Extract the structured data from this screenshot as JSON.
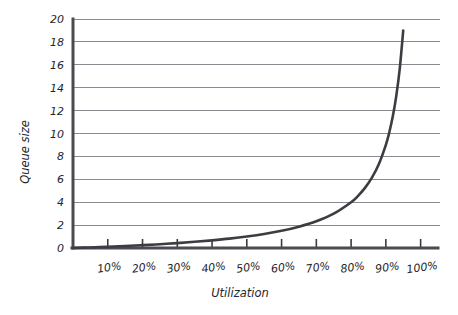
{
  "chart_data": {
    "type": "line",
    "title": "",
    "xlabel": "Utilization",
    "ylabel": "Queue size",
    "xlim": [
      0,
      105
    ],
    "ylim": [
      0,
      20
    ],
    "grid": true,
    "legend": false,
    "x_tick_labels": [
      "10%",
      "20%",
      "30%",
      "40%",
      "50%",
      "60%",
      "70%",
      "80%",
      "90%",
      "100%"
    ],
    "x_tick_values": [
      10,
      20,
      30,
      40,
      50,
      60,
      70,
      80,
      90,
      100
    ],
    "y_tick_labels": [
      "0",
      "2",
      "4",
      "6",
      "8",
      "10",
      "12",
      "14",
      "16",
      "18",
      "20"
    ],
    "y_tick_values": [
      0,
      2,
      4,
      6,
      8,
      10,
      12,
      14,
      16,
      18,
      20
    ],
    "series": [
      {
        "name": "Queue size",
        "color": "#3c3c42",
        "x": [
          0,
          5,
          10,
          15,
          20,
          25,
          30,
          35,
          40,
          45,
          50,
          55,
          60,
          65,
          70,
          75,
          80,
          82,
          84,
          86,
          88,
          90,
          91,
          92,
          93,
          94,
          95
        ],
        "values": [
          0,
          0.05,
          0.11,
          0.18,
          0.25,
          0.33,
          0.43,
          0.54,
          0.67,
          0.82,
          1.0,
          1.22,
          1.5,
          1.86,
          2.33,
          3.0,
          4.0,
          4.56,
          5.25,
          6.14,
          7.33,
          9.0,
          10.11,
          11.5,
          13.29,
          15.67,
          19.0
        ]
      }
    ],
    "annotations": []
  },
  "figure": {
    "background_color": "#ffffff",
    "axis_color": "#4a4a50",
    "grid_color": "#8a8a90",
    "text_color": "#25252a"
  }
}
